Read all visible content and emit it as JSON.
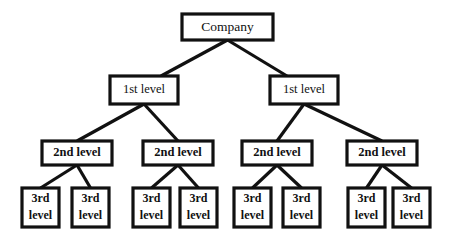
{
  "diagram": {
    "type": "tree",
    "background_color": "#ffffff",
    "line_color": "#111111",
    "box_fill_color": "#ffffff",
    "labels": {
      "root": "Company",
      "level1": "1st level",
      "level2": "2nd level",
      "level3_line1": "3rd",
      "level3_line2": "level"
    },
    "nodes": {
      "root": {
        "label": "Company",
        "x": 182,
        "y": 14,
        "w": 91,
        "h": 26,
        "cx": 227.5,
        "cy": 27
      },
      "level1": [
        {
          "label": "1st level",
          "x": 110,
          "y": 76,
          "w": 68,
          "h": 28,
          "cx": 144,
          "cy": 90
        },
        {
          "label": "1st level",
          "x": 270,
          "y": 76,
          "w": 68,
          "h": 28,
          "cx": 304,
          "cy": 90
        }
      ],
      "level2": [
        {
          "label": "2nd level",
          "x": 42,
          "y": 141,
          "w": 70,
          "h": 24,
          "cx": 77,
          "cy": 153
        },
        {
          "label": "2nd level",
          "x": 143,
          "y": 141,
          "w": 70,
          "h": 24,
          "cx": 178,
          "cy": 153
        },
        {
          "label": "2nd level",
          "x": 242,
          "y": 141,
          "w": 70,
          "h": 24,
          "cx": 277,
          "cy": 153
        },
        {
          "label": "2nd level",
          "x": 347,
          "y": 141,
          "w": 70,
          "h": 24,
          "cx": 382,
          "cy": 153
        }
      ],
      "level3": [
        {
          "line1": "3rd",
          "line2": "level",
          "x": 22,
          "y": 188,
          "w": 37,
          "h": 39,
          "cx": 40.5,
          "cy": 207.5
        },
        {
          "line1": "3rd",
          "line2": "level",
          "x": 72,
          "y": 188,
          "w": 37,
          "h": 39,
          "cx": 90.5,
          "cy": 207.5
        },
        {
          "line1": "3rd",
          "line2": "level",
          "x": 133,
          "y": 188,
          "w": 37,
          "h": 39,
          "cx": 151.5,
          "cy": 207.5
        },
        {
          "line1": "3rd",
          "line2": "level",
          "x": 180,
          "y": 188,
          "w": 37,
          "h": 39,
          "cx": 198.5,
          "cy": 207.5
        },
        {
          "line1": "3rd",
          "line2": "level",
          "x": 234,
          "y": 188,
          "w": 37,
          "h": 39,
          "cx": 252.5,
          "cy": 207.5
        },
        {
          "line1": "3rd",
          "line2": "level",
          "x": 283,
          "y": 188,
          "w": 37,
          "h": 39,
          "cx": 301.5,
          "cy": 207.5
        },
        {
          "line1": "3rd",
          "line2": "level",
          "x": 348,
          "y": 188,
          "w": 37,
          "h": 39,
          "cx": 366.5,
          "cy": 207.5
        },
        {
          "line1": "3rd",
          "line2": "level",
          "x": 393,
          "y": 188,
          "w": 37,
          "h": 39,
          "cx": 411.5,
          "cy": 207.5
        }
      ]
    },
    "edges": [
      {
        "from": "root",
        "to": "level1-0",
        "x1": 227.5,
        "y1": 40,
        "x2": 161,
        "y2": 76
      },
      {
        "from": "root",
        "to": "level1-1",
        "x1": 227.5,
        "y1": 40,
        "x2": 287,
        "y2": 76
      },
      {
        "from": "level1-0",
        "to": "level2-0",
        "x1": 144,
        "y1": 104,
        "x2": 77,
        "y2": 141
      },
      {
        "from": "level1-0",
        "to": "level2-1",
        "x1": 144,
        "y1": 104,
        "x2": 178,
        "y2": 141
      },
      {
        "from": "level1-1",
        "to": "level2-2",
        "x1": 304,
        "y1": 104,
        "x2": 277,
        "y2": 141
      },
      {
        "from": "level1-1",
        "to": "level2-3",
        "x1": 304,
        "y1": 104,
        "x2": 382,
        "y2": 141
      },
      {
        "from": "level2-0",
        "to": "level3-0",
        "x1": 77,
        "y1": 165,
        "x2": 40.5,
        "y2": 188
      },
      {
        "from": "level2-0",
        "to": "level3-1",
        "x1": 77,
        "y1": 165,
        "x2": 90.5,
        "y2": 188
      },
      {
        "from": "level2-1",
        "to": "level3-2",
        "x1": 178,
        "y1": 165,
        "x2": 151.5,
        "y2": 188
      },
      {
        "from": "level2-1",
        "to": "level3-3",
        "x1": 178,
        "y1": 165,
        "x2": 198.5,
        "y2": 188
      },
      {
        "from": "level2-2",
        "to": "level3-4",
        "x1": 277,
        "y1": 165,
        "x2": 252.5,
        "y2": 188
      },
      {
        "from": "level2-2",
        "to": "level3-5",
        "x1": 277,
        "y1": 165,
        "x2": 301.5,
        "y2": 188
      },
      {
        "from": "level2-3",
        "to": "level3-6",
        "x1": 382,
        "y1": 165,
        "x2": 366.5,
        "y2": 188
      },
      {
        "from": "level2-3",
        "to": "level3-7",
        "x1": 382,
        "y1": 165,
        "x2": 411.5,
        "y2": 188
      }
    ]
  }
}
